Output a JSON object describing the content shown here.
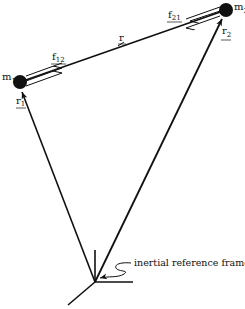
{
  "diagram": {
    "colors": {
      "ink": "#111111",
      "background": "#ffffff"
    },
    "masses": [
      {
        "id": "m1",
        "label": "m",
        "subscript": "1",
        "x": 20,
        "y": 82
      },
      {
        "id": "m2",
        "label": "m",
        "subscript": "2",
        "x": 226,
        "y": 10
      }
    ],
    "vectors": {
      "r": {
        "label": "r"
      },
      "r1": {
        "label": "r",
        "subscript": "1"
      },
      "r2": {
        "label": "r",
        "subscript": "2"
      },
      "f12": {
        "label": "f",
        "subscript": "12"
      },
      "f21": {
        "label": "f",
        "subscript": "21"
      }
    },
    "frame": {
      "origin": {
        "x": 95,
        "y": 282
      },
      "label": "inertial reference frame"
    },
    "caption": ""
  }
}
